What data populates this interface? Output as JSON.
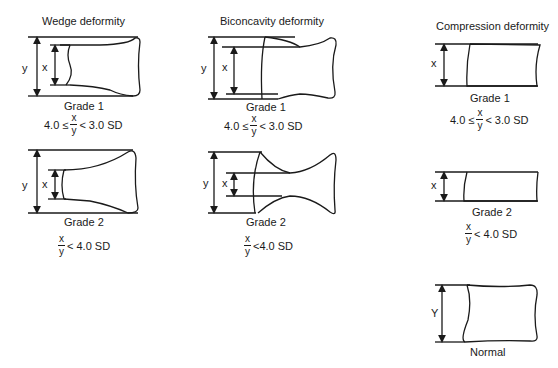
{
  "columns": [
    {
      "title": "Wedge deformity",
      "items": [
        {
          "grade": "Grade 1",
          "formula": {
            "prefix": "4.0 ≤",
            "num": "x",
            "den": "y",
            "suffix": "< 3.0 SD"
          },
          "labels": {
            "outer": "y",
            "inner": "x"
          }
        },
        {
          "grade": "Grade 2",
          "formula": {
            "prefix": "",
            "num": "x",
            "den": "y",
            "suffix": "< 4.0 SD"
          },
          "labels": {
            "outer": "y",
            "inner": "x"
          }
        }
      ]
    },
    {
      "title": "Biconcavity deformity",
      "items": [
        {
          "grade": "Grade 1",
          "formula": {
            "prefix": "4.0 ≤",
            "num": "x",
            "den": "y",
            "suffix": "< 3.0 SD"
          },
          "labels": {
            "outer": "y",
            "inner": "x"
          }
        },
        {
          "grade": "Grade 2",
          "formula": {
            "prefix": "",
            "num": "x",
            "den": "y",
            "suffix": "<4.0 SD"
          },
          "labels": {
            "outer": "y",
            "inner": "x"
          }
        }
      ]
    },
    {
      "title": "Compression deformity",
      "items": [
        {
          "grade": "Grade 1",
          "formula": {
            "prefix": "4.0 ≤",
            "num": "x",
            "den": "y",
            "suffix": "< 3.0 SD"
          },
          "labels": {
            "inner": "x"
          }
        },
        {
          "grade": "Grade 2",
          "formula": {
            "prefix": "",
            "num": "x",
            "den": "y",
            "suffix": "< 4.0 SD"
          },
          "labels": {
            "inner": "x"
          }
        },
        {
          "grade": "Normal",
          "labels": {
            "inner": "Y"
          }
        }
      ]
    }
  ]
}
